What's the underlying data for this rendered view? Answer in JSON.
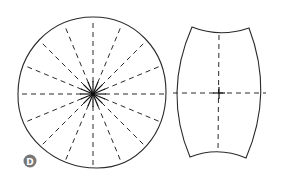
{
  "figure": {
    "label": "D",
    "colors": {
      "line": "#2a2a2a",
      "badge": "#777777",
      "background": "#ffffff"
    },
    "left_shape": {
      "type": "circle-pattern-piece",
      "radial_lines": 16
    },
    "right_shape": {
      "type": "barrel-pattern-piece",
      "guide_lines": [
        "horizontal",
        "vertical"
      ]
    }
  }
}
